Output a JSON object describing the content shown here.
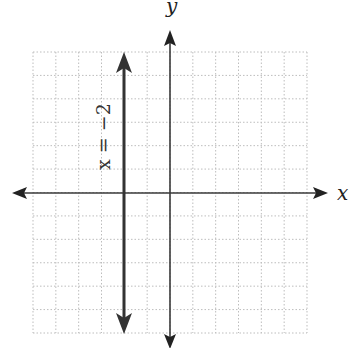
{
  "chart_data": {
    "type": "line",
    "title": "",
    "xlabel": "x",
    "ylabel": "y",
    "xlim": [
      -6,
      6
    ],
    "ylim": [
      -6,
      6
    ],
    "grid": true,
    "grid_style": "dotted",
    "series": [
      {
        "name": "x = −2",
        "equation": "x = -2",
        "kind": "vertical-line",
        "x": [
          -2,
          -2
        ],
        "y": [
          -6,
          6
        ],
        "arrows": "both"
      }
    ]
  },
  "labels": {
    "x_axis": "x",
    "y_axis": "y",
    "line": "x = −2"
  },
  "colors": {
    "axis": "#3a3a3a",
    "line": "#333333",
    "grid": "#bdbdbd"
  }
}
